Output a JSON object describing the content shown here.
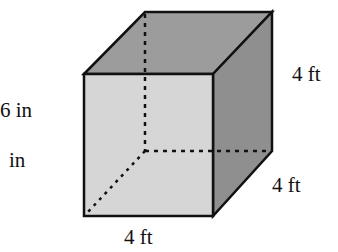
{
  "figure": {
    "type": "cube-diagram",
    "colors": {
      "top_face": "#9c9c9c",
      "front_face": "#d6d6d6",
      "right_face": "#8f8f8f",
      "edge": "#111111",
      "hidden_edge": "#111111"
    },
    "vertices": {
      "front_top_left": [
        84,
        74
      ],
      "front_top_right": [
        213,
        74
      ],
      "front_bottom_left": [
        84,
        216
      ],
      "front_bottom_right": [
        213,
        216
      ],
      "back_top_left": [
        145,
        12
      ],
      "back_top_right": [
        272,
        12
      ],
      "back_bottom_right": [
        272,
        151
      ],
      "back_bottom_left_hidden": [
        145,
        151
      ]
    }
  },
  "labels": {
    "left_top": "6 in",
    "left_bottom": "in",
    "bottom": "4 ft",
    "right_depth": "4 ft",
    "right_height": "4 ft"
  }
}
